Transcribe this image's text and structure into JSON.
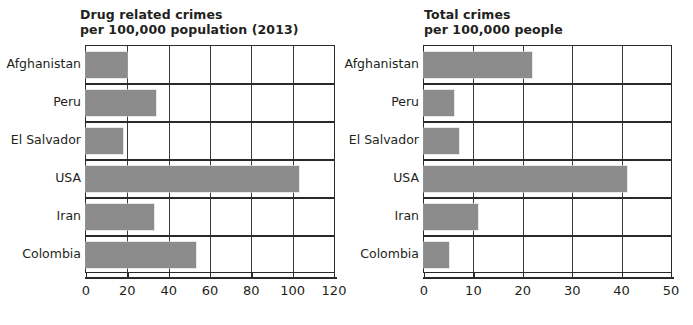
{
  "chart_data": [
    {
      "type": "bar",
      "orientation": "horizontal",
      "title": "Drug related crimes per 100,000 population (2013)",
      "title_lines": [
        "Drug related crimes",
        "per 100,000 population (2013)"
      ],
      "xlabel": "",
      "ylabel": "",
      "categories": [
        "Afghanistan",
        "Peru",
        "El Salvador",
        "USA",
        "Iran",
        "Colombia"
      ],
      "values": [
        20,
        34,
        18,
        103,
        33,
        53
      ],
      "xlim": [
        0,
        120
      ],
      "xticks": [
        0,
        20,
        40,
        60,
        80,
        100,
        120
      ],
      "xtick_labels": [
        "0",
        "20",
        "40",
        "60",
        "80",
        "100",
        "120"
      ],
      "grid": "vertical",
      "legend": "none",
      "bar_color": "#8c8c8c"
    },
    {
      "type": "bar",
      "orientation": "horizontal",
      "title": "Total crimes per 100,000 people",
      "title_lines": [
        "Total crimes",
        "per 100,000 people"
      ],
      "xlabel": "",
      "ylabel": "",
      "categories": [
        "Afghanistan",
        "Peru",
        "El Salvador",
        "USA",
        "Iran",
        "Colombia"
      ],
      "values": [
        21.8,
        6,
        7,
        41,
        11,
        5
      ],
      "xlim": [
        0,
        50
      ],
      "xticks": [
        0,
        10,
        20,
        30,
        40,
        50
      ],
      "xtick_labels": [
        "0",
        "10",
        "20",
        "30",
        "40",
        "50"
      ],
      "grid": "vertical",
      "legend": "none",
      "bar_color": "#8c8c8c"
    }
  ],
  "colors": {
    "bar_fill": "#8c8c8c",
    "axis": "#2a2a2a",
    "grid": "#3a3a3a",
    "background": "#ffffff",
    "text": "#231f20"
  }
}
